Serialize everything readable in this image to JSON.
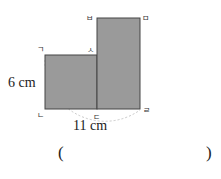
{
  "figure": {
    "shapes": [
      {
        "name": "small-rectangle",
        "fill": "#9a9a9a"
      },
      {
        "name": "tall-rectangle",
        "fill": "#9a9a9a"
      }
    ],
    "vertex_labels": {
      "giyeok": "ㄱ",
      "nieun": "ㄴ",
      "digeut": "ㄷ",
      "rieul": "ㄹ",
      "mieum": "ㅁ",
      "bieup": "ㅂ",
      "siot": "ㅅ"
    },
    "measurements": {
      "height": "6 cm",
      "base_arc": "11 cm"
    }
  },
  "answer": {
    "open_paren": "(",
    "close_paren": ")",
    "value": ""
  }
}
